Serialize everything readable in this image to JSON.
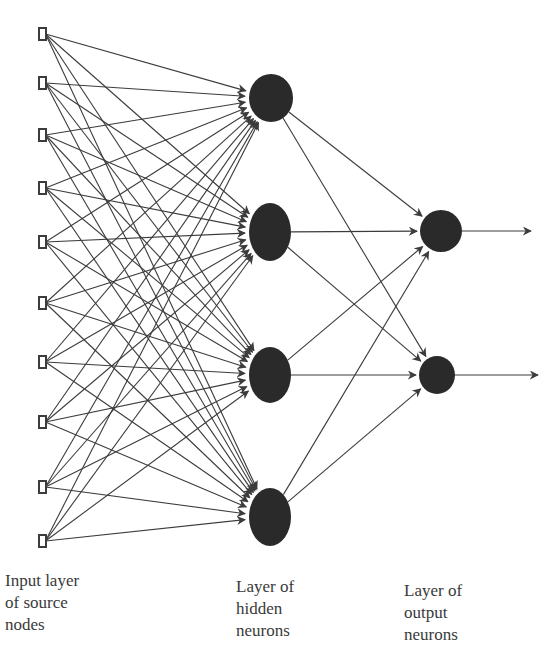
{
  "diagram": {
    "colors": {
      "line": "#3c3c3c",
      "node_fill": "#2a2a2a",
      "input_stroke": "#3c3c3c",
      "text": "#3a3a3a"
    },
    "input_layer": {
      "x": 42,
      "node_width": 7,
      "node_height": 12,
      "nodes_y": [
        34,
        83,
        135,
        188,
        242,
        303,
        362,
        422,
        487,
        541
      ]
    },
    "hidden_layer": {
      "neurons": [
        {
          "cx": 271,
          "cy": 98,
          "rx": 22,
          "ry": 24
        },
        {
          "cx": 270,
          "cy": 232,
          "rx": 21,
          "ry": 29
        },
        {
          "cx": 270,
          "cy": 375,
          "rx": 21,
          "ry": 28
        },
        {
          "cx": 270,
          "cy": 517,
          "rx": 21,
          "ry": 29
        }
      ]
    },
    "output_layer": {
      "neurons": [
        {
          "cx": 441,
          "cy": 231,
          "rx": 21,
          "ry": 21
        },
        {
          "cx": 437,
          "cy": 375,
          "rx": 18,
          "ry": 19
        }
      ],
      "output_arrow_end_x": [
        531,
        538
      ]
    }
  },
  "labels": {
    "input": [
      "Input layer",
      "of source",
      "nodes"
    ],
    "hidden": [
      "Layer of",
      "hidden",
      "neurons"
    ],
    "output": [
      "Layer of",
      "output",
      "neurons"
    ]
  }
}
